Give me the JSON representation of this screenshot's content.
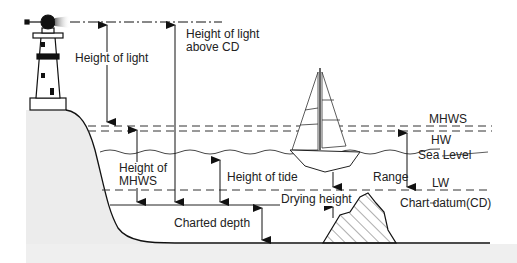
{
  "diagram": {
    "labels": {
      "height_of_light": "Height of light",
      "height_of_light_above_cd_line1": "Height of light",
      "height_of_light_above_cd_line2": "above CD",
      "height_of_mhws_line1": "Height of",
      "height_of_mhws_line2": "MHWS",
      "height_of_tide": "Height of tide",
      "charted_depth": "Charted depth",
      "drying_height": "Drying height",
      "range": "Range",
      "mhws": "MHWS",
      "hw": "HW",
      "sea_level": "Sea Level",
      "lw": "LW",
      "chart_datum": "Chart datum(CD)"
    },
    "colors": {
      "line": "#222222",
      "land": "#ececec",
      "water": "#ffffff"
    },
    "elements": [
      "lighthouse",
      "sailboat",
      "rock (drying)",
      "seabed",
      "cliff"
    ]
  }
}
